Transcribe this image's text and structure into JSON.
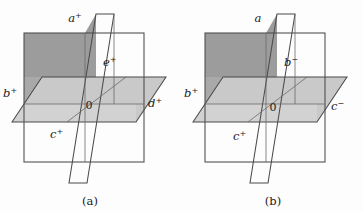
{
  "figure": {
    "background_color": "#fdfdfd",
    "width": 363,
    "height": 213,
    "colors": {
      "plane_dark": "#9c9c9c",
      "plane_mid": "#a9a9a9",
      "plane_light": "#c9c9c9",
      "edge_stroke": "#4a4a4a",
      "text": "#1a1a1a"
    }
  },
  "panels": [
    {
      "id": "a",
      "caption": "(a)",
      "labels": {
        "slant_top": {
          "base": "a",
          "sup": "+"
        },
        "vertical_right": {
          "base": "e",
          "sup": "+"
        },
        "horiz_left": {
          "base": "b",
          "sup": "+"
        },
        "horiz_right": {
          "base": "d",
          "sup": "+"
        },
        "front_bottom": {
          "base": "c",
          "sup": "+"
        },
        "origin": "0"
      }
    },
    {
      "id": "b",
      "caption": "(b)",
      "labels": {
        "slant_top": {
          "base": "a",
          "sup": ""
        },
        "vertical_right": {
          "base": "b",
          "sup": "−"
        },
        "horiz_left": {
          "base": "b",
          "sup": "+"
        },
        "horiz_right": {
          "base": "c",
          "sup": "−"
        },
        "front_bottom": {
          "base": "c",
          "sup": "+"
        },
        "origin": "0"
      }
    }
  ]
}
